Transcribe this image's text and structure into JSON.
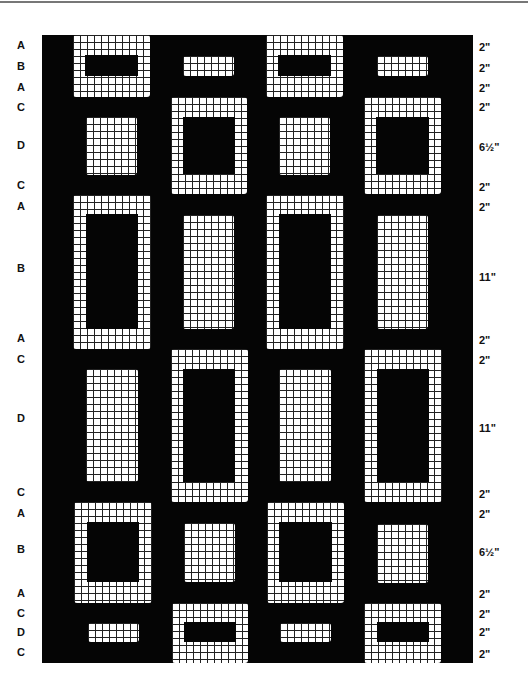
{
  "figure": {
    "colors": {
      "background": "#050505",
      "grid_fill": "#ffffff",
      "grid_lines": "#222222"
    },
    "columns": 4,
    "rows": [
      {
        "label": "A",
        "measure": "2\""
      },
      {
        "label": "B",
        "measure": "2\""
      },
      {
        "label": "A",
        "measure": "2\""
      },
      {
        "label": "C",
        "measure": "2\""
      },
      {
        "label": "D",
        "measure": "6½\""
      },
      {
        "label": "C",
        "measure": "2\""
      },
      {
        "label": "A",
        "measure": "2\""
      },
      {
        "label": "B",
        "measure": "11\""
      },
      {
        "label": "A",
        "measure": "2\""
      },
      {
        "label": "C",
        "measure": "2\""
      },
      {
        "label": "D",
        "measure": "11\""
      },
      {
        "label": "C",
        "measure": "2\""
      },
      {
        "label": "A",
        "measure": "2\""
      },
      {
        "label": "B",
        "measure": "6½\""
      },
      {
        "label": "A",
        "measure": "2\""
      },
      {
        "label": "C",
        "measure": "2\""
      },
      {
        "label": "D",
        "measure": "2\""
      },
      {
        "label": "C",
        "measure": "2\""
      }
    ],
    "sections": [
      {
        "rows": "A-B-A",
        "sizes": [
          "2\"",
          "2\"",
          "2\""
        ],
        "framed_columns": [
          1,
          3
        ],
        "inset_columns": [
          2,
          4
        ]
      },
      {
        "rows": "C-D-C",
        "sizes": [
          "2\"",
          "6½\"",
          "2\""
        ],
        "framed_columns": [
          2,
          4
        ],
        "inset_columns": [
          1,
          3
        ]
      },
      {
        "rows": "A-B-A",
        "sizes": [
          "2\"",
          "11\"",
          "2\""
        ],
        "framed_columns": [
          1,
          3
        ],
        "inset_columns": [
          2,
          4
        ]
      },
      {
        "rows": "C-D-C",
        "sizes": [
          "2\"",
          "11\"",
          "2\""
        ],
        "framed_columns": [
          2,
          4
        ],
        "inset_columns": [
          1,
          3
        ]
      },
      {
        "rows": "A-B-A",
        "sizes": [
          "2\"",
          "6½\"",
          "2\""
        ],
        "framed_columns": [
          1,
          3
        ],
        "inset_columns": [
          2,
          4
        ]
      },
      {
        "rows": "C-D-C",
        "sizes": [
          "2\"",
          "2\"",
          "2\""
        ],
        "framed_columns": [
          2,
          4
        ],
        "inset_columns": [
          1,
          3
        ]
      }
    ]
  }
}
